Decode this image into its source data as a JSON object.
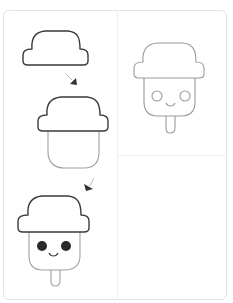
{
  "colors": {
    "outline_dark": "#3a3a3a",
    "outline_light": "#9a9a9a",
    "frame_border": "#e4e4e4",
    "divider": "#efefef",
    "eye_fill": "#2a2a2a",
    "arrow": "#333333"
  },
  "steps": [
    {
      "index": 1,
      "description": "Draw the hat shape"
    },
    {
      "index": 2,
      "description": "Add the popsicle body below the hat"
    },
    {
      "index": 3,
      "description": "Add eyes, smile and stick"
    }
  ],
  "final_panel": {
    "description": "Finished light-outline popsicle with hat"
  }
}
